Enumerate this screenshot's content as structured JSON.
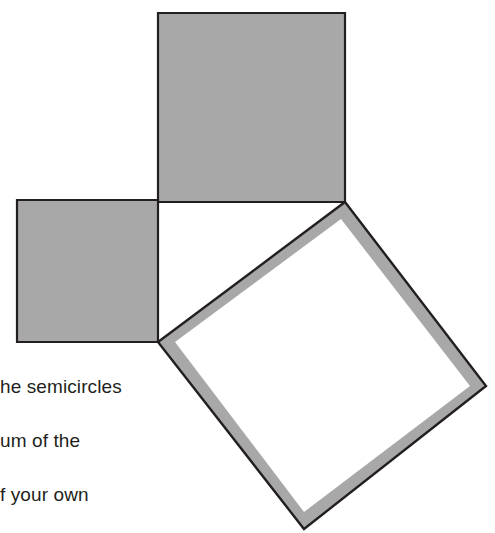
{
  "figure": {
    "background_color": "#ffffff",
    "fill_color": "#a8a8a8",
    "outline_color": "#231f20",
    "band_color": "#a8a8a8",
    "interior_color": "#ffffff",
    "shapes": [
      {
        "name": "upper-square",
        "kind": "filled-square",
        "label": "large shaded square",
        "points": "158,13 345,13 345,202 158,202"
      },
      {
        "name": "left-square",
        "kind": "filled-square",
        "label": "small shaded square",
        "points": "17,200 158,200 158,342 17,342"
      },
      {
        "name": "tilted-square",
        "kind": "outlined-square",
        "label": "tilted open square",
        "outer_points": "345,202 486,386 304,529 158,342",
        "inner_points": "341,219 470,386 304,512 175,342"
      }
    ]
  },
  "caption": {
    "lines": [
      "he semicircles",
      "um of the",
      "f your own"
    ]
  }
}
